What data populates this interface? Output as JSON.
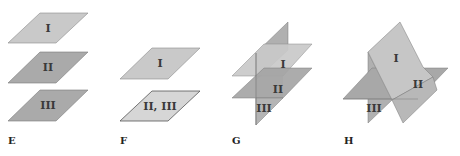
{
  "figure": {
    "colors": {
      "plane_light": "#c9c9c9",
      "plane_mid": "#b4b4b4",
      "plane_dark": "#a3a3a3",
      "plane_lightest": "#d6d6d6",
      "edge": "#7a7a7a"
    },
    "panels": [
      {
        "id": "E",
        "label": "E",
        "planes": [
          "I",
          "II",
          "III"
        ],
        "description": "three parallel planes"
      },
      {
        "id": "F",
        "label": "F",
        "planes": [
          "I",
          "II, III"
        ],
        "description": "two parallel planes, II and III coincide"
      },
      {
        "id": "G",
        "label": "G",
        "planes": [
          "I",
          "II",
          "III"
        ],
        "description": "two parallel planes cut by a third"
      },
      {
        "id": "H",
        "label": "H",
        "planes": [
          "I",
          "II",
          "III"
        ],
        "description": "three planes intersecting in a line"
      }
    ]
  }
}
